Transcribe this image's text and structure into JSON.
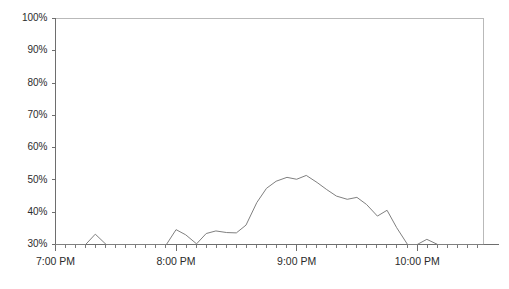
{
  "chart_data": {
    "type": "line",
    "title": "",
    "subtitle": "",
    "xlabel": "",
    "ylabel": "",
    "grid": false,
    "legend": false,
    "legend_position": "none",
    "line_color": "#808080",
    "axis_color": "#6e6e6e",
    "frame_color": "#b9b9b9",
    "text_color": "#2b2b2b",
    "background_color": "#ffffff",
    "ylim": [
      30,
      100
    ],
    "ytick_values": [
      30,
      40,
      50,
      60,
      70,
      80,
      90,
      100
    ],
    "ytick_labels": [
      "30%",
      "40%",
      "50%",
      "60%",
      "70%",
      "80%",
      "90%",
      "100%"
    ],
    "xlim": [
      19.0,
      22.55
    ],
    "xtick_values": [
      19,
      20,
      21,
      22
    ],
    "xtick_labels": [
      "7:00 PM",
      "8:00 PM",
      "9:00 PM",
      "10:00 PM"
    ],
    "x_minor_tick_interval_hours": 0.0833,
    "series": [
      {
        "name": "value",
        "x": [
          19.0,
          19.08,
          19.17,
          19.25,
          19.33,
          19.42,
          19.5,
          19.58,
          19.67,
          19.75,
          19.83,
          19.92,
          20.0,
          20.08,
          20.17,
          20.25,
          20.33,
          20.42,
          20.5,
          20.58,
          20.67,
          20.75,
          20.83,
          20.92,
          21.0,
          21.08,
          21.17,
          21.25,
          21.33,
          21.42,
          21.5,
          21.58,
          21.67,
          21.75,
          21.83,
          21.92,
          22.0,
          22.08,
          22.17,
          22.25,
          22.33,
          22.42,
          22.55
        ],
        "values": [
          30.0,
          30.0,
          30.0,
          30.0,
          33.2,
          30.0,
          30.0,
          30.0,
          30.0,
          30.0,
          30.0,
          30.0,
          34.6,
          33.0,
          30.2,
          33.4,
          34.2,
          33.7,
          33.6,
          36.0,
          43.0,
          47.4,
          49.6,
          50.8,
          50.2,
          51.4,
          49.2,
          47.0,
          45.0,
          44.0,
          44.6,
          42.4,
          38.8,
          40.6,
          35.2,
          30.0,
          30.0,
          31.6,
          30.0,
          30.0,
          30.0,
          30.0,
          30.0
        ]
      }
    ]
  }
}
